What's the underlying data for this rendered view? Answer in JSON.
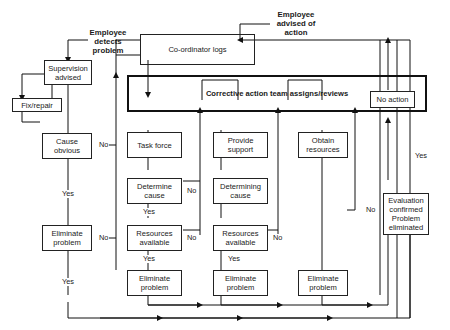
{
  "diagram": {
    "type": "flowchart",
    "annotations": {
      "employee_detects": "Employee detects problem",
      "employee_advised": "Employee advised of action"
    },
    "nodes": {
      "supervision": "Supervision advised",
      "fix_repair": "Fix/repair",
      "cause_obvious": "Cause obvious",
      "eliminate_left": "Eliminate problem",
      "coordinator": "Co-ordinator logs",
      "team": "Corrective action team assigns/reviews",
      "no_action": "No action",
      "task_force": "Task force",
      "determine_cause": "Determine cause",
      "resources_1": "Resources available",
      "eliminate_1": "Eliminate problem",
      "provide_support": "Provide support",
      "determining_cause": "Determining cause",
      "resources_2": "Resources available",
      "eliminate_2": "Eliminate problem",
      "obtain_resources": "Obtain resources",
      "eliminate_3": "Eliminate problem",
      "evaluation": "Evaluation confirmed Problem eliminated"
    },
    "edge_labels": {
      "yes": "Yes",
      "no": "No"
    }
  }
}
